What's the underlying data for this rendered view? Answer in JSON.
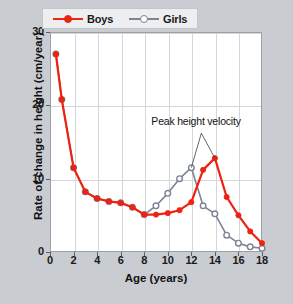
{
  "chart_data": {
    "type": "line",
    "title": "",
    "xlabel": "Age (years)",
    "ylabel": "Rate of change in height (cm/year)",
    "xlim": [
      0,
      18
    ],
    "ylim": [
      0,
      30
    ],
    "xticks": [
      0,
      2,
      4,
      6,
      8,
      10,
      12,
      14,
      16,
      18
    ],
    "yticks": [
      0,
      10,
      20,
      30
    ],
    "grid": true,
    "legend_position": "top-left",
    "annotations": [
      {
        "text": "Peak height velocity",
        "points_to": [
          "girls-peak",
          "boys-peak"
        ]
      }
    ],
    "series": [
      {
        "name": "Boys",
        "color": "#ee2211",
        "marker": "filled-circle",
        "x": [
          0.5,
          1,
          2,
          3,
          4,
          5,
          6,
          7,
          8,
          9,
          10,
          11,
          12,
          13,
          14,
          15,
          16,
          17,
          18
        ],
        "y": [
          27.0,
          20.8,
          11.5,
          8.2,
          7.3,
          6.9,
          6.7,
          6.1,
          5.1,
          5.1,
          5.3,
          5.7,
          6.8,
          11.2,
          12.8,
          7.5,
          5.0,
          2.8,
          1.2
        ]
      },
      {
        "name": "Girls",
        "color": "#7b8494",
        "marker": "open-circle",
        "x": [
          0.5,
          1,
          2,
          3,
          4,
          5,
          6,
          7,
          8,
          9,
          10,
          11,
          12,
          13,
          14,
          15,
          16,
          17,
          18
        ],
        "y": [
          27.0,
          20.8,
          11.5,
          8.2,
          7.3,
          6.9,
          6.7,
          6.1,
          5.1,
          6.3,
          8.0,
          10.0,
          11.5,
          6.3,
          5.2,
          2.3,
          1.2,
          0.7,
          0.5
        ]
      }
    ]
  },
  "legend": {
    "items": [
      {
        "label": "Boys",
        "color": "#ee2211"
      },
      {
        "label": "Girls",
        "color": "#7b8494"
      }
    ]
  },
  "annotation": {
    "label": "Peak height velocity"
  }
}
